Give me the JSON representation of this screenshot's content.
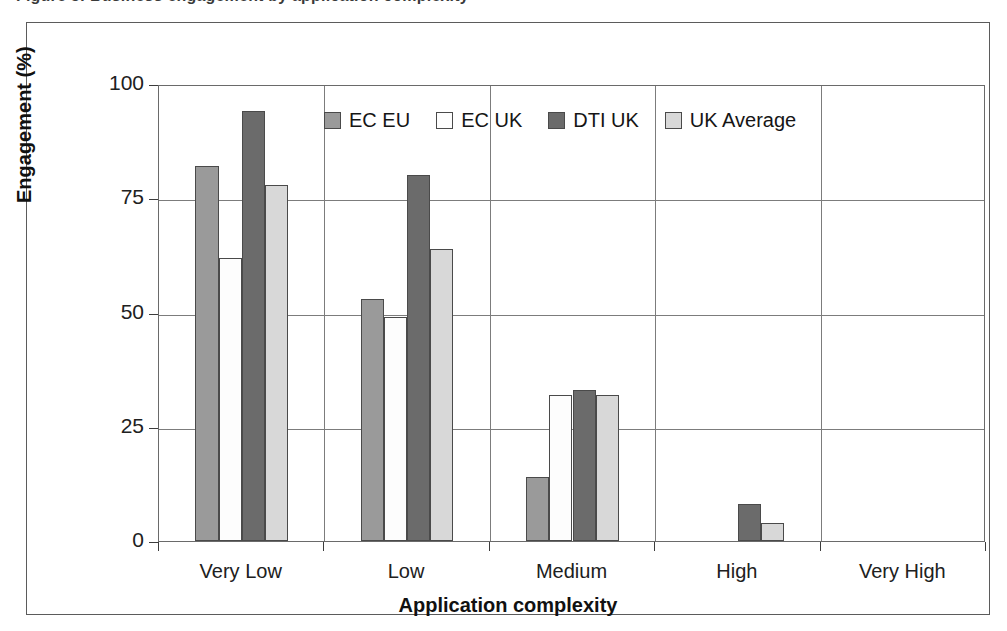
{
  "caption": {
    "text": "Figure 5: Business engagement by application complexity"
  },
  "chart_data": {
    "type": "bar",
    "title": "",
    "xlabel": "Application complexity",
    "ylabel": "Engagement (%)",
    "categories": [
      "Very Low",
      "Low",
      "Medium",
      "High",
      "Very High"
    ],
    "series": [
      {
        "name": "EC EU",
        "values": [
          82,
          53,
          14,
          0,
          0
        ],
        "color": "#9a9a9a"
      },
      {
        "name": "EC UK",
        "values": [
          62,
          49,
          32,
          0,
          0
        ],
        "color": "#fdfdfd"
      },
      {
        "name": "DTI UK",
        "values": [
          94,
          80,
          33,
          8,
          0
        ],
        "color": "#6b6b6b"
      },
      {
        "name": "UK Average",
        "values": [
          78,
          64,
          32,
          4,
          0
        ],
        "color": "#d8d8d8"
      }
    ],
    "ylim": [
      0,
      100
    ],
    "yticks": [
      0,
      25,
      50,
      75,
      100
    ],
    "ytick_labels": [
      "0",
      "25",
      "50",
      "75",
      "100"
    ],
    "grid": true,
    "grid_axis": "y",
    "legend_position": "top-center-inside"
  }
}
